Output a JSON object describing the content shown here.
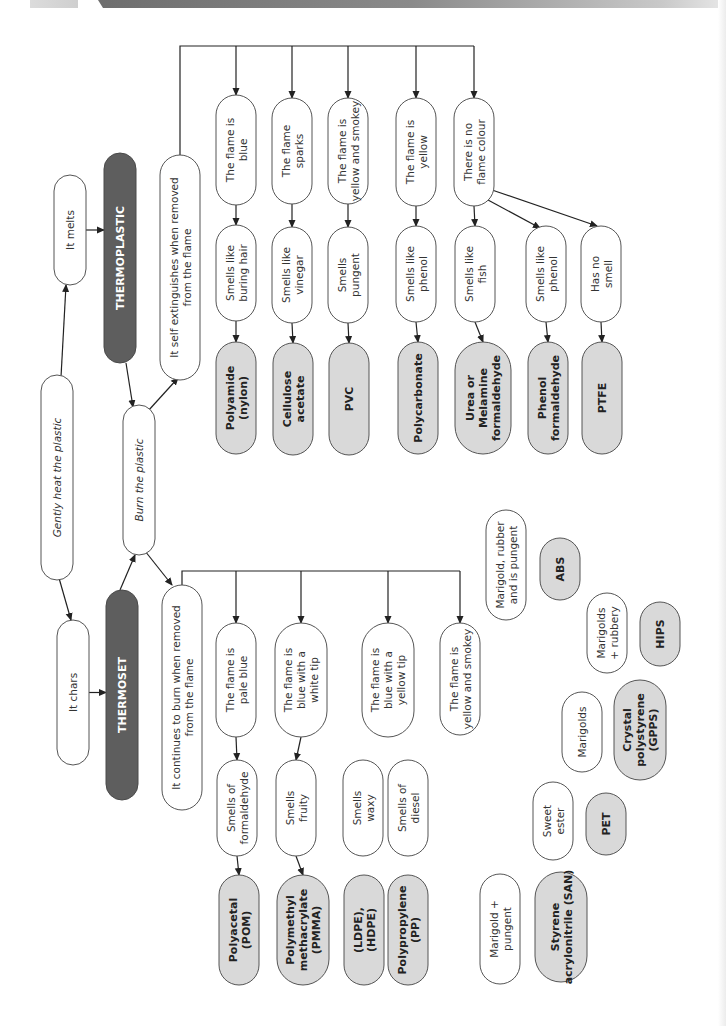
{
  "diagram": {
    "type": "flowchart",
    "orientation": "rotated-90-ccw",
    "nodes": [
      {
        "id": "gently_heat",
        "text": [
          "Gently heat the plastic"
        ],
        "kind": "step",
        "italic": true
      },
      {
        "id": "it_melts",
        "text": [
          "It melts"
        ],
        "kind": "step"
      },
      {
        "id": "thermoplastic",
        "text": [
          "THERMOPLASTIC"
        ],
        "kind": "category"
      },
      {
        "id": "it_chars",
        "text": [
          "It chars"
        ],
        "kind": "step"
      },
      {
        "id": "thermoset",
        "text": [
          "THERMOSET"
        ],
        "kind": "category"
      },
      {
        "id": "burn",
        "text": [
          "Burn the plastic"
        ],
        "kind": "step",
        "italic": true
      },
      {
        "id": "self_ext",
        "text": [
          "It self extinguishes when removed",
          "from the flame"
        ],
        "kind": "step"
      },
      {
        "id": "continues",
        "text": [
          "It continues to burn when removed",
          "from the flame"
        ],
        "kind": "step"
      },
      {
        "id": "tp_flame_blue",
        "text": [
          "The flame is",
          "blue"
        ],
        "kind": "step"
      },
      {
        "id": "tp_smell_hair",
        "text": [
          "Smells like",
          "buring hair"
        ],
        "kind": "step"
      },
      {
        "id": "tp_res_nylon",
        "text": [
          "Polyamide",
          "(nylon)"
        ],
        "kind": "result"
      },
      {
        "id": "tp_flame_sparks",
        "text": [
          "The flame",
          "sparks"
        ],
        "kind": "step"
      },
      {
        "id": "tp_smell_vinegar",
        "text": [
          "Smells like",
          "vinegar"
        ],
        "kind": "step"
      },
      {
        "id": "tp_res_ca",
        "text": [
          "Cellulose",
          "acetate"
        ],
        "kind": "result"
      },
      {
        "id": "tp_flame_ys",
        "text": [
          "The flame is",
          "yellow and smokey"
        ],
        "kind": "step"
      },
      {
        "id": "tp_smell_pungent",
        "text": [
          "Smells",
          "pungent"
        ],
        "kind": "step"
      },
      {
        "id": "tp_res_pvc",
        "text": [
          "PVC"
        ],
        "kind": "result"
      },
      {
        "id": "tp_flame_yellow",
        "text": [
          "The flame is",
          "yellow"
        ],
        "kind": "step"
      },
      {
        "id": "tp_smell_phenol",
        "text": [
          "Smells like",
          "phenol"
        ],
        "kind": "step"
      },
      {
        "id": "tp_res_pc",
        "text": [
          "Polycarbonate"
        ],
        "kind": "result"
      },
      {
        "id": "tp_flame_none",
        "text": [
          "There is no",
          "flame colour"
        ],
        "kind": "step"
      },
      {
        "id": "tp_smell_fish",
        "text": [
          "Smells like",
          "fish"
        ],
        "kind": "step"
      },
      {
        "id": "tp_res_urea",
        "text": [
          "Urea or",
          "Melamine",
          "formaldehyde"
        ],
        "kind": "result"
      },
      {
        "id": "tp_smell_phenol2",
        "text": [
          "Smells like",
          "phenol"
        ],
        "kind": "step"
      },
      {
        "id": "tp_res_phenol",
        "text": [
          "Phenol",
          "formaldehyde"
        ],
        "kind": "result"
      },
      {
        "id": "tp_smell_none",
        "text": [
          "Has no",
          "smell"
        ],
        "kind": "step"
      },
      {
        "id": "tp_res_ptfe",
        "text": [
          "PTFE"
        ],
        "kind": "result"
      },
      {
        "id": "ts_flame_pale",
        "text": [
          "The flame is",
          "pale blue"
        ],
        "kind": "step"
      },
      {
        "id": "ts_smell_form",
        "text": [
          "Smells of",
          "formaldehyde"
        ],
        "kind": "step"
      },
      {
        "id": "ts_res_pom",
        "text": [
          "Polyacetal",
          "(POM)"
        ],
        "kind": "result"
      },
      {
        "id": "ts_flame_white",
        "text": [
          "The flame is",
          "blue with a",
          "white tip"
        ],
        "kind": "step"
      },
      {
        "id": "ts_smell_fruity",
        "text": [
          "Smells",
          "fruity"
        ],
        "kind": "step"
      },
      {
        "id": "ts_res_pmma",
        "text": [
          "Polymethyl",
          "methacrylate",
          "(PMMA)"
        ],
        "kind": "result"
      },
      {
        "id": "ts_flame_ytip",
        "text": [
          "The flame is",
          "blue with a",
          "yellow tip"
        ],
        "kind": "step"
      },
      {
        "id": "ts_smell_waxy",
        "text": [
          "Smells",
          "waxy"
        ],
        "kind": "step"
      },
      {
        "id": "ts_res_pe",
        "text": [
          "(LDPE),",
          "(HDPE)"
        ],
        "kind": "result"
      },
      {
        "id": "ts_smell_diesel",
        "text": [
          "Smells of",
          "diesel"
        ],
        "kind": "step"
      },
      {
        "id": "ts_res_pp",
        "text": [
          "Polypropylene",
          "(PP)"
        ],
        "kind": "result"
      },
      {
        "id": "ts_flame_ys",
        "text": [
          "The flame is",
          "yellow and smokey"
        ],
        "kind": "step"
      },
      {
        "id": "ts_smell_abs",
        "text": [
          "Marigold, rubber",
          "and is pungent"
        ],
        "kind": "step"
      },
      {
        "id": "ts_res_abs",
        "text": [
          "ABS"
        ],
        "kind": "result"
      },
      {
        "id": "ts_smell_hips",
        "text": [
          "Marigolds",
          "+ rubbery"
        ],
        "kind": "step"
      },
      {
        "id": "ts_res_hips",
        "text": [
          "HIPS"
        ],
        "kind": "result"
      },
      {
        "id": "ts_smell_gpps",
        "text": [
          "Marigolds"
        ],
        "kind": "step"
      },
      {
        "id": "ts_res_gpps",
        "text": [
          "Crystal",
          "polystyrene",
          "(GPPS)"
        ],
        "kind": "result"
      },
      {
        "id": "ts_smell_pet",
        "text": [
          "Sweet",
          "ester"
        ],
        "kind": "step"
      },
      {
        "id": "ts_res_pet",
        "text": [
          "PET"
        ],
        "kind": "result"
      },
      {
        "id": "ts_smell_san",
        "text": [
          "Marigold +",
          "pungent"
        ],
        "kind": "step"
      },
      {
        "id": "ts_res_san",
        "text": [
          "Styrene",
          "acrylonitrile (SAN)"
        ],
        "kind": "result"
      }
    ],
    "edges": [
      [
        "gently_heat",
        "it_melts"
      ],
      [
        "gently_heat",
        "it_chars"
      ],
      [
        "it_melts",
        "thermoplastic"
      ],
      [
        "it_chars",
        "thermoset"
      ],
      [
        "thermoplastic",
        "burn"
      ],
      [
        "thermoset",
        "burn"
      ],
      [
        "burn",
        "self_ext"
      ],
      [
        "burn",
        "continues"
      ],
      [
        "self_ext",
        "tp_flame_blue"
      ],
      [
        "self_ext",
        "tp_flame_sparks"
      ],
      [
        "self_ext",
        "tp_flame_ys"
      ],
      [
        "self_ext",
        "tp_flame_yellow"
      ],
      [
        "self_ext",
        "tp_flame_none"
      ],
      [
        "tp_flame_blue",
        "tp_smell_hair"
      ],
      [
        "tp_smell_hair",
        "tp_res_nylon"
      ],
      [
        "tp_flame_sparks",
        "tp_smell_vinegar"
      ],
      [
        "tp_smell_vinegar",
        "tp_res_ca"
      ],
      [
        "tp_flame_ys",
        "tp_smell_pungent"
      ],
      [
        "tp_smell_pungent",
        "tp_res_pvc"
      ],
      [
        "tp_flame_yellow",
        "tp_smell_phenol"
      ],
      [
        "tp_smell_phenol",
        "tp_res_pc"
      ],
      [
        "tp_flame_none",
        "tp_smell_fish"
      ],
      [
        "tp_smell_fish",
        "tp_res_urea"
      ],
      [
        "tp_flame_none",
        "tp_smell_phenol2"
      ],
      [
        "tp_smell_phenol2",
        "tp_res_phenol"
      ],
      [
        "tp_flame_none",
        "tp_smell_none"
      ],
      [
        "tp_smell_none",
        "tp_res_ptfe"
      ],
      [
        "continues",
        "ts_flame_pale"
      ],
      [
        "continues",
        "ts_flame_white"
      ],
      [
        "continues",
        "ts_flame_ytip"
      ],
      [
        "continues",
        "ts_flame_ys"
      ],
      [
        "ts_flame_pale",
        "ts_smell_form"
      ],
      [
        "ts_smell_form",
        "ts_res_pom"
      ],
      [
        "ts_flame_white",
        "ts_smell_fruity"
      ],
      [
        "ts_smell_fruity",
        "ts_res_pmma"
      ],
      [
        "ts_flame_ytip",
        "ts_smell_waxy"
      ],
      [
        "ts_smell_waxy",
        "ts_res_pe"
      ],
      [
        "ts_flame_ytip",
        "ts_smell_diesel"
      ],
      [
        "ts_smell_diesel",
        "ts_res_pp"
      ],
      [
        "ts_flame_ys",
        "ts_smell_abs"
      ],
      [
        "ts_smell_abs",
        "ts_res_abs"
      ],
      [
        "ts_flame_ys",
        "ts_smell_hips"
      ],
      [
        "ts_smell_hips",
        "ts_res_hips"
      ],
      [
        "ts_flame_ys",
        "ts_smell_gpps"
      ],
      [
        "ts_smell_gpps",
        "ts_res_gpps"
      ],
      [
        "ts_flame_ys",
        "ts_smell_pet"
      ],
      [
        "ts_smell_pet",
        "ts_res_pet"
      ],
      [
        "ts_flame_ys",
        "ts_smell_san"
      ],
      [
        "ts_smell_san",
        "ts_res_san"
      ]
    ]
  },
  "colors": {
    "category_fill": "#5e5e5e",
    "result_fill": "#d9d9d9",
    "step_fill": "#ffffff",
    "line": "#222222",
    "banner": "#7a7a7a"
  }
}
